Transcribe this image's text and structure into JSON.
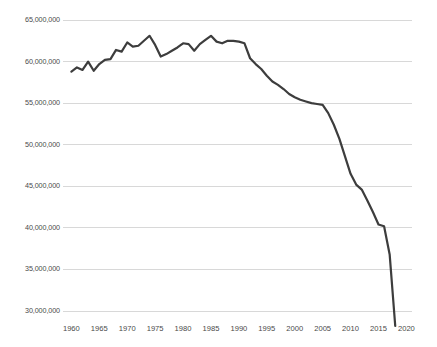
{
  "chart_data": {
    "type": "line",
    "title": "",
    "subtitle": "",
    "xlabel": "",
    "ylabel": "",
    "grid": true,
    "legend": false,
    "legend_position": "none",
    "line_color": "#3d3d3d",
    "grid_color": "#d8d8d8",
    "axis_text_color": "#4a4a4a",
    "background": "#ffffff",
    "xlim": [
      1958.5,
      2021
    ],
    "ylim": [
      27000000,
      66500000
    ],
    "x_ticks": [
      1960,
      1965,
      1970,
      1975,
      1980,
      1985,
      1990,
      1995,
      2000,
      2005,
      2010,
      2015,
      2020
    ],
    "x_tick_labels": [
      "1960",
      "1965",
      "1970",
      "1975",
      "1980",
      "1985",
      "1990",
      "1995",
      "2000",
      "2005",
      "2010",
      "2015",
      "2020"
    ],
    "y_ticks": [
      30000000,
      35000000,
      40000000,
      45000000,
      50000000,
      55000000,
      60000000,
      65000000
    ],
    "y_tick_labels": [
      "30,000,000",
      "35,000,000",
      "40,000,000",
      "45,000,000",
      "50,000,000",
      "55,000,000",
      "60,000,000",
      "65,000,000"
    ],
    "x": [
      1960,
      1961,
      1962,
      1963,
      1964,
      1965,
      1966,
      1967,
      1968,
      1969,
      1970,
      1971,
      1972,
      1973,
      1974,
      1975,
      1976,
      1977,
      1978,
      1979,
      1980,
      1981,
      1982,
      1983,
      1984,
      1985,
      1986,
      1987,
      1988,
      1989,
      1990,
      1991,
      1992,
      1993,
      1994,
      1995,
      1996,
      1997,
      1998,
      1999,
      2000,
      2001,
      2002,
      2003,
      2004,
      2005,
      2006,
      2007,
      2008,
      2009,
      2010,
      2011,
      2012,
      2013,
      2014,
      2015,
      2016,
      2017,
      2018
    ],
    "values": [
      58800000,
      59300000,
      59000000,
      60000000,
      58900000,
      59700000,
      60200000,
      60300000,
      61400000,
      61200000,
      62300000,
      61800000,
      61900000,
      62500000,
      63100000,
      62000000,
      60600000,
      60900000,
      61300000,
      61700000,
      62200000,
      62100000,
      61300000,
      62100000,
      62600000,
      63100000,
      62400000,
      62200000,
      62500000,
      62500000,
      62400000,
      62200000,
      60400000,
      59700000,
      59100000,
      58300000,
      57600000,
      57200000,
      56700000,
      56100000,
      55700000,
      55400000,
      55200000,
      55000000,
      54900000,
      54800000,
      53800000,
      52400000,
      50700000,
      48600000,
      46500000,
      45200000,
      44600000,
      43300000,
      41900000,
      40400000,
      40200000,
      36800000,
      28200000
    ],
    "series": [
      {
        "name": "value",
        "values": [
          58800000,
          59300000,
          59000000,
          60000000,
          58900000,
          59700000,
          60200000,
          60300000,
          61400000,
          61200000,
          62300000,
          61800000,
          61900000,
          62500000,
          63100000,
          62000000,
          60600000,
          60900000,
          61300000,
          61700000,
          62200000,
          62100000,
          61300000,
          62100000,
          62600000,
          63100000,
          62400000,
          62200000,
          62500000,
          62500000,
          62400000,
          62200000,
          60400000,
          59700000,
          59100000,
          58300000,
          57600000,
          57200000,
          56700000,
          56100000,
          55700000,
          55400000,
          55200000,
          55000000,
          54900000,
          54800000,
          53800000,
          52400000,
          50700000,
          48600000,
          46500000,
          45200000,
          44600000,
          43300000,
          41900000,
          40400000,
          40200000,
          36800000,
          28200000
        ]
      }
    ],
    "annotations": []
  }
}
